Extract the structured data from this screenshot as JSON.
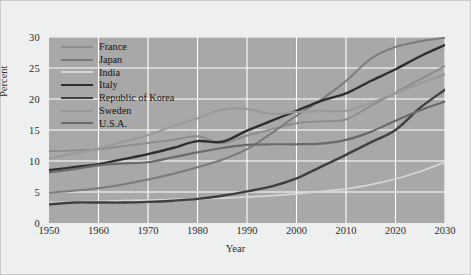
{
  "chart_data": {
    "type": "line",
    "title": "",
    "xlabel": "Year",
    "ylabel": "Percent",
    "xlim": [
      1950,
      2030
    ],
    "ylim": [
      0,
      30
    ],
    "xticks": [
      1950,
      1960,
      1970,
      1980,
      1990,
      2000,
      2010,
      2020,
      2030
    ],
    "yticks": [
      0,
      5,
      10,
      15,
      20,
      25,
      30
    ],
    "grid": true,
    "legend_position": "upper-left",
    "plot_background": "#a8a8a8",
    "figure_background": "#eef0ef",
    "gridline_color": "#ffffff",
    "x": [
      1950,
      1955,
      1960,
      1965,
      1970,
      1975,
      1980,
      1985,
      1990,
      1995,
      2000,
      2005,
      2010,
      2015,
      2020,
      2025,
      2030
    ],
    "series": [
      {
        "name": "France",
        "color": "#8d8d8d",
        "width": 2.0,
        "values": [
          11.6,
          11.7,
          11.9,
          12.4,
          12.9,
          13.4,
          14.0,
          12.9,
          14.1,
          15.1,
          16.1,
          16.4,
          16.7,
          18.9,
          21.0,
          23.2,
          25.3
        ]
      },
      {
        "name": "Japan",
        "color": "#7b7b7b",
        "width": 2.0,
        "values": [
          4.9,
          5.2,
          5.6,
          6.2,
          7.0,
          7.9,
          9.0,
          10.2,
          11.9,
          14.5,
          17.3,
          19.9,
          22.9,
          26.5,
          28.4,
          29.3,
          29.9
        ]
      },
      {
        "name": "India",
        "color": "#d6d6d6",
        "width": 1.7,
        "values": [
          3.3,
          3.4,
          3.5,
          3.6,
          3.7,
          3.8,
          3.9,
          4.0,
          4.2,
          4.4,
          4.7,
          5.1,
          5.5,
          6.2,
          7.1,
          8.3,
          9.8
        ]
      },
      {
        "name": "Italy",
        "color": "#2e2e2e",
        "width": 2.4,
        "values": [
          8.5,
          9.0,
          9.5,
          10.3,
          11.1,
          12.1,
          13.2,
          13.1,
          14.9,
          16.5,
          18.1,
          19.7,
          20.9,
          22.9,
          24.8,
          26.9,
          28.7
        ]
      },
      {
        "name": "Republic of Korea",
        "color": "#3f3f3f",
        "width": 2.4,
        "values": [
          3.0,
          3.3,
          3.3,
          3.3,
          3.4,
          3.6,
          3.9,
          4.4,
          5.1,
          5.9,
          7.2,
          9.1,
          11.0,
          13.0,
          15.0,
          18.6,
          21.5
        ]
      },
      {
        "name": "Sweden",
        "color": "#9a9a9a",
        "width": 2.2,
        "values": [
          10.4,
          11.2,
          12.0,
          13.1,
          14.2,
          15.6,
          16.9,
          18.3,
          18.4,
          17.6,
          17.9,
          18.1,
          18.1,
          19.4,
          20.9,
          22.5,
          24.0
        ]
      },
      {
        "name": "U.S.A.",
        "color": "#6a6a6a",
        "width": 2.2,
        "values": [
          8.2,
          8.7,
          9.3,
          9.6,
          9.8,
          10.6,
          11.4,
          12.1,
          12.6,
          12.7,
          12.7,
          12.8,
          13.4,
          14.7,
          16.5,
          18.2,
          19.6
        ]
      }
    ]
  },
  "legend": {
    "items": [
      {
        "label": "France"
      },
      {
        "label": "Japan"
      },
      {
        "label": "India"
      },
      {
        "label": "Italy"
      },
      {
        "label": "Republic of Korea"
      },
      {
        "label": "Sweden"
      },
      {
        "label": "U.S.A."
      }
    ]
  }
}
